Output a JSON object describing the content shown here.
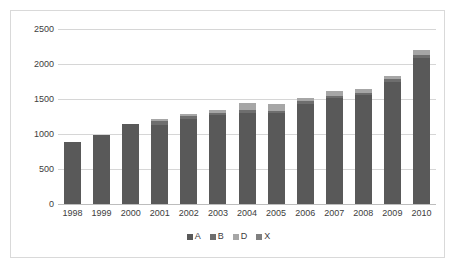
{
  "chart_data": {
    "type": "bar",
    "subtype": "stacked-column",
    "title": "",
    "subtitle": "",
    "xlabel": "",
    "ylabel": "",
    "ylim": [
      0,
      2500
    ],
    "yticks": [
      0,
      500,
      1000,
      1500,
      2000,
      2500
    ],
    "ytick_labels": [
      "0",
      "500",
      "1000",
      "1500",
      "2000",
      "2500"
    ],
    "grid": true,
    "legend_position": "bottom",
    "categories": [
      "1998",
      "1999",
      "2000",
      "2001",
      "2002",
      "2003",
      "2004",
      "2005",
      "2006",
      "2007",
      "2008",
      "2009",
      "2010"
    ],
    "series": [
      {
        "name": "A",
        "color": "#595959",
        "values": [
          885,
          980,
          1145,
          1130,
          1210,
          1265,
          1295,
          1300,
          1425,
          1520,
          1555,
          1745,
          2090
        ]
      },
      {
        "name": "B",
        "color": "#6e6e6e",
        "values": [
          0,
          0,
          0,
          55,
          50,
          35,
          55,
          35,
          40,
          30,
          30,
          35,
          35
        ]
      },
      {
        "name": "D",
        "color": "#a6a6a6",
        "values": [
          0,
          0,
          5,
          30,
          25,
          50,
          90,
          90,
          45,
          60,
          60,
          45,
          75
        ]
      },
      {
        "name": "X",
        "color": "#7f7f7f",
        "values": [
          0,
          0,
          0,
          0,
          0,
          0,
          0,
          0,
          0,
          0,
          0,
          0,
          0
        ]
      }
    ],
    "totals": [
      885,
      980,
      1150,
      1215,
      1285,
      1350,
      1440,
      1425,
      1510,
      1610,
      1645,
      1825,
      2200
    ]
  },
  "legend": {
    "entries": [
      {
        "label": "A",
        "color": "#595959"
      },
      {
        "label": "B",
        "color": "#6e6e6e"
      },
      {
        "label": "D",
        "color": "#a6a6a6"
      },
      {
        "label": "X",
        "color": "#7f7f7f"
      }
    ]
  },
  "style": {
    "frame_border": "#d9d9d9",
    "gridline": "#d6d6d6",
    "axis_text": "#3d3d3d",
    "background": "#ffffff"
  }
}
